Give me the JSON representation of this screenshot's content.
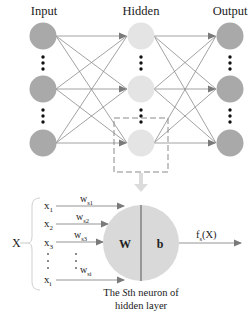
{
  "layers": {
    "input_label": "Input",
    "hidden_label": "Hidden",
    "output_label": "Output"
  },
  "neuron_detail": {
    "input_set_label": "X",
    "inputs": [
      {
        "name": "x",
        "sub": "1"
      },
      {
        "name": "x",
        "sub": "2"
      },
      {
        "name": "x",
        "sub": "3"
      },
      {
        "name": "x",
        "sub": "i"
      }
    ],
    "weights": [
      {
        "name": "w",
        "sub": "s1"
      },
      {
        "name": "w",
        "sub": "s2"
      },
      {
        "name": "w",
        "sub": "s3"
      },
      {
        "name": "w",
        "sub": "si"
      }
    ],
    "weight_symbol": "W",
    "bias_symbol": "b",
    "output_fn": "f",
    "output_fn_sub": "s",
    "output_fn_arg": "(X)",
    "caption_line1_prefix": "The ",
    "caption_italic": "S",
    "caption_line1_suffix": "th neuron of",
    "caption_line2": "hidden layer"
  },
  "colors": {
    "input_node": "#a9a9a9",
    "hidden_node": "#e4e4e4",
    "output_node": "#a9a9a9",
    "detail_node": "#d9d9d9",
    "edge": "#8a8a8a",
    "arrow": "#7a7a7a",
    "dashed_box": "#8a8a8a",
    "down_arrow": "#dcdcdc"
  }
}
